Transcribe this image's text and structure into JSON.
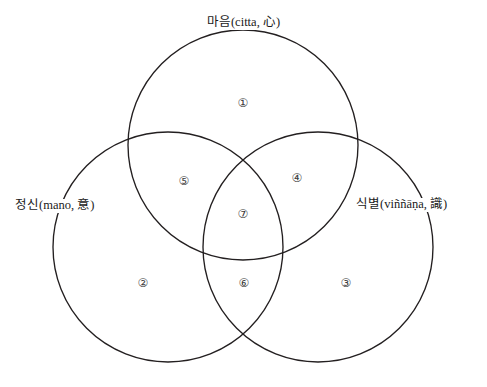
{
  "diagram": {
    "type": "venn-3-set",
    "title_visible": false,
    "background_color": "#ffffff",
    "stroke_color": "#231f20",
    "sets": [
      {
        "id": "citta",
        "label": "마음(citta, 心)",
        "korean": "마음",
        "pali": "citta",
        "hanja": "心",
        "position": "top"
      },
      {
        "id": "mano",
        "label": "정신(mano, 意)",
        "korean": "정신",
        "pali": "mano",
        "hanja": "意",
        "position": "left"
      },
      {
        "id": "vinnana",
        "label": "식별(viññāṇa, 識)",
        "korean": "식별",
        "pali": "viññāṇa",
        "hanja": "識",
        "position": "right"
      }
    ],
    "regions": [
      {
        "id": "region-1",
        "marker": "①",
        "belongs_to": [
          "citta"
        ]
      },
      {
        "id": "region-2",
        "marker": "②",
        "belongs_to": [
          "mano"
        ]
      },
      {
        "id": "region-3",
        "marker": "③",
        "belongs_to": [
          "vinnana"
        ]
      },
      {
        "id": "region-4",
        "marker": "④",
        "belongs_to": [
          "citta",
          "vinnana"
        ]
      },
      {
        "id": "region-5",
        "marker": "⑤",
        "belongs_to": [
          "citta",
          "mano"
        ]
      },
      {
        "id": "region-6",
        "marker": "⑥",
        "belongs_to": [
          "mano",
          "vinnana"
        ]
      },
      {
        "id": "region-7",
        "marker": "⑦",
        "belongs_to": [
          "citta",
          "mano",
          "vinnana"
        ]
      }
    ]
  }
}
